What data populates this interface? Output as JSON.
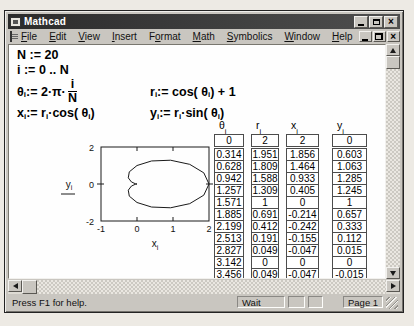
{
  "window": {
    "title": "Mathcad"
  },
  "menu": {
    "items": [
      {
        "label": "File",
        "underline": 0
      },
      {
        "label": "Edit",
        "underline": 0
      },
      {
        "label": "View",
        "underline": 0
      },
      {
        "label": "Insert",
        "underline": 0
      },
      {
        "label": "Format",
        "underline": 1
      },
      {
        "label": "Math",
        "underline": 0
      },
      {
        "label": "Symbolics",
        "underline": 0
      },
      {
        "label": "Window",
        "underline": 0
      },
      {
        "label": "Help",
        "underline": 0
      }
    ]
  },
  "math": {
    "rows": [
      [
        {
          "tokens": [
            {
              "t": "N := 20"
            }
          ]
        }
      ],
      [
        {
          "tokens": [
            {
              "t": "i := 0 .. N"
            }
          ]
        }
      ],
      [
        {
          "tokens": [
            {
              "t": "θ"
            },
            {
              "s": "i"
            },
            {
              "t": " := 2·π·"
            },
            {
              "f": [
                "i",
                "N"
              ]
            }
          ]
        },
        {
          "tokens": [
            {
              "t": "r"
            },
            {
              "s": "i"
            },
            {
              "t": " := cos( θ"
            },
            {
              "s": "i"
            },
            {
              "t": " ) + 1"
            }
          ]
        }
      ],
      [
        {
          "tokens": [
            {
              "t": "x"
            },
            {
              "s": "i"
            },
            {
              "t": " := r"
            },
            {
              "s": "i"
            },
            {
              "t": "·cos( θ"
            },
            {
              "s": "i"
            },
            {
              "t": " )"
            }
          ]
        },
        {
          "tokens": [
            {
              "t": "y"
            },
            {
              "s": "i"
            },
            {
              "t": " := r"
            },
            {
              "s": "i"
            },
            {
              "t": "·sin( θ"
            },
            {
              "s": "i"
            },
            {
              "t": " )"
            }
          ]
        }
      ]
    ]
  },
  "chart_data": {
    "type": "line",
    "title": "",
    "xlabel": {
      "base": "x",
      "sub": "i"
    },
    "ylabel": {
      "base": "y",
      "sub": "i"
    },
    "xlim": [
      -1,
      2
    ],
    "ylim": [
      -2,
      2
    ],
    "xticks": [
      -1,
      0,
      1,
      2
    ],
    "yticks": [
      -2,
      0,
      2
    ],
    "x": [
      2,
      1.856,
      1.464,
      0.933,
      0.405,
      0,
      -0.214,
      -0.242,
      -0.155,
      -0.047,
      0,
      -0.047,
      -0.155,
      -0.242,
      -0.214,
      0,
      0.405,
      0.933,
      1.464,
      1.856,
      2
    ],
    "y": [
      0,
      0.603,
      1.063,
      1.285,
      1.245,
      1,
      0.657,
      0.333,
      0.112,
      0.015,
      0,
      -0.015,
      -0.112,
      -0.333,
      -0.657,
      -1,
      -1.245,
      -1.285,
      -1.063,
      -0.603,
      0
    ]
  },
  "tables": {
    "columns": [
      {
        "header": {
          "base": "θ",
          "sub": "i"
        },
        "values": [
          "0",
          "0.314",
          "0.628",
          "0.942",
          "1.257",
          "1.571",
          "1.885",
          "2.199",
          "2.513",
          "2.827",
          "3.142",
          "3.456"
        ]
      },
      {
        "header": {
          "base": "r",
          "sub": "i"
        },
        "values": [
          "2",
          "1.951",
          "1.809",
          "1.588",
          "1.309",
          "1",
          "0.691",
          "0.412",
          "0.191",
          "0.049",
          "0",
          "0.049"
        ]
      },
      {
        "header": {
          "base": "x",
          "sub": "i"
        },
        "values": [
          "2",
          "1.856",
          "1.464",
          "0.933",
          "0.405",
          "0",
          "-0.214",
          "-0.242",
          "-0.155",
          "-0.047",
          "0",
          "-0.047"
        ]
      },
      {
        "header": {
          "base": "y",
          "sub": "i"
        },
        "values": [
          "0",
          "0.603",
          "1.063",
          "1.285",
          "1.245",
          "1",
          "0.657",
          "0.333",
          "0.112",
          "0.015",
          "0",
          "-0.015"
        ]
      }
    ]
  },
  "statusbar": {
    "message": "Press F1 for help.",
    "mode": "Wait",
    "panel2": "",
    "panel3": "",
    "page": "Page 1"
  }
}
